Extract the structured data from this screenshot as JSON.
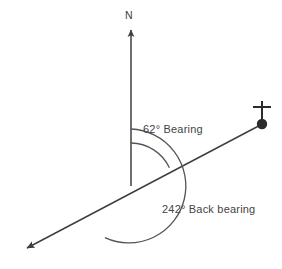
{
  "diagram": {
    "type": "compass-bearing-diagram",
    "labels": {
      "north": "N",
      "bearing": "62° Bearing",
      "back_bearing": "242° Back bearing"
    },
    "values": {
      "bearing_degrees": 62,
      "back_bearing_degrees": 242,
      "bearing_unit": "°"
    },
    "colors": {
      "line": "#3f3f3f",
      "arc": "#555555",
      "text": "#444444",
      "background": "#ffffff",
      "station_marker": "#2b2b2b"
    },
    "geometry": {
      "vertex": {
        "x": 131,
        "y": 186
      },
      "north_arrow_tip": {
        "x": 131,
        "y": 27
      },
      "station_point": {
        "x": 262,
        "y": 124
      },
      "back_arrow_tip": {
        "x": 24,
        "y": 250
      },
      "bearing_arc_radius": 43,
      "back_bearing_arc_radius": 57
    },
    "icons": {
      "north_arrow": "arrow-up-icon",
      "station_marker": "survey-station-icon",
      "back_arrow": "arrow-down-left-icon"
    }
  }
}
